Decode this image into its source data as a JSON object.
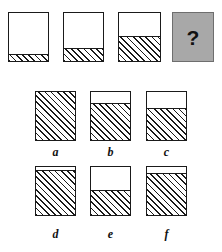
{
  "puzzle": {
    "type": "visual-analogy-fill-level",
    "colors": {
      "ink": "#1a1a1a",
      "paper": "#ffffff",
      "question_fill": "#a8a8a8",
      "question_border": "#6e6e6e"
    },
    "sequence": {
      "name": "top-row-sequence",
      "items": [
        {
          "id": "seq-1",
          "fill_percent": 12,
          "style": "hatched",
          "x": 8,
          "y": 12,
          "w": 41,
          "h": 50
        },
        {
          "id": "seq-2",
          "fill_percent": 26,
          "style": "hatched",
          "x": 63,
          "y": 12,
          "w": 41,
          "h": 50
        },
        {
          "id": "seq-3",
          "fill_percent": 50,
          "style": "hatched",
          "x": 118,
          "y": 12,
          "w": 43,
          "h": 50
        },
        {
          "id": "seq-4",
          "fill_percent": null,
          "style": "question",
          "label": "?",
          "x": 172,
          "y": 12,
          "w": 42,
          "h": 50
        }
      ]
    },
    "options": {
      "name": "answer-options",
      "items": [
        {
          "id": "opt-a",
          "label": "a",
          "fill_percent": 100,
          "style": "hatched",
          "x": 35,
          "y": 91,
          "w": 41,
          "h": 50,
          "label_x": 35,
          "label_y": 146
        },
        {
          "id": "opt-b",
          "label": "b",
          "fill_percent": 76,
          "style": "hatched",
          "x": 90,
          "y": 91,
          "w": 41,
          "h": 50,
          "label_x": 90,
          "label_y": 146
        },
        {
          "id": "opt-c",
          "label": "c",
          "fill_percent": 64,
          "style": "hatched",
          "x": 146,
          "y": 91,
          "w": 41,
          "h": 50,
          "label_x": 146,
          "label_y": 146
        },
        {
          "id": "opt-d",
          "label": "d",
          "fill_percent": 92,
          "style": "hatched",
          "x": 35,
          "y": 166,
          "w": 41,
          "h": 50,
          "label_x": 35,
          "label_y": 228
        },
        {
          "id": "opt-e",
          "label": "e",
          "fill_percent": 50,
          "style": "hatched",
          "x": 90,
          "y": 166,
          "w": 41,
          "h": 50,
          "label_x": 90,
          "label_y": 228
        },
        {
          "id": "opt-f",
          "label": "f",
          "fill_percent": 85,
          "style": "hatched",
          "x": 146,
          "y": 166,
          "w": 41,
          "h": 50,
          "label_x": 146,
          "label_y": 228
        }
      ]
    }
  }
}
